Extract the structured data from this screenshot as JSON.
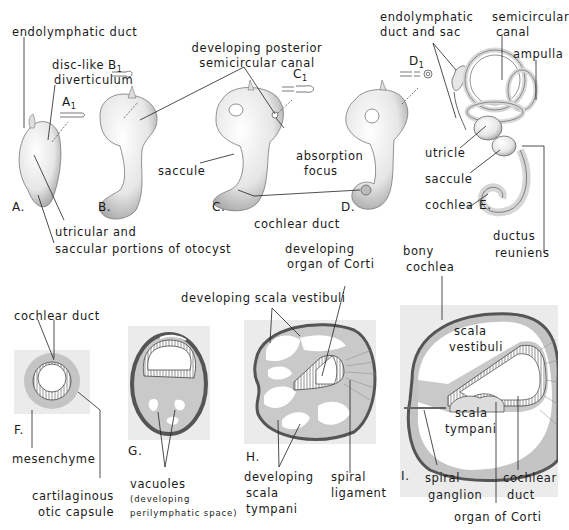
{
  "figure": {
    "top_row": {
      "panels": [
        {
          "id": "A",
          "label": "A.",
          "inset": "A",
          "inset_sub": "1"
        },
        {
          "id": "B",
          "label": "B.",
          "inset": "B",
          "inset_sub": "1"
        },
        {
          "id": "C",
          "label": "C.",
          "inset": "C",
          "inset_sub": "1"
        },
        {
          "id": "D",
          "label": "D.",
          "inset": "D",
          "inset_sub": "1"
        },
        {
          "id": "E",
          "label": "E."
        }
      ],
      "labels": {
        "endolymphatic_duct": "endolymphatic duct",
        "disc_like_1": "disc-like",
        "disc_like_2": "diverticulum",
        "dev_post_1": "developing posterior",
        "dev_post_2": "semicircular canal",
        "endo_duct_sac_1": "endolymphatic",
        "endo_duct_sac_2": "duct and sac",
        "semicircular_1": "semicircular",
        "semicircular_2": "canal",
        "ampulla": "ampulla",
        "saccule_c": "saccule",
        "absorption_1": "absorption",
        "absorption_2": "focus",
        "utricle": "utricle",
        "saccule_e": "saccule",
        "cochlea": "cochlea",
        "cochlear_duct": "cochlear duct",
        "utricular_1": "utricular and",
        "utricular_2": "saccular portions of otocyst",
        "ductus_1": "ductus",
        "ductus_2": "reuniens"
      }
    },
    "bottom_row": {
      "panels": [
        {
          "id": "F",
          "label": "F."
        },
        {
          "id": "G",
          "label": "G."
        },
        {
          "id": "H",
          "label": "H."
        },
        {
          "id": "I",
          "label": "I."
        }
      ],
      "labels": {
        "cochlear_duct_f": "cochlear duct",
        "mesenchyme": "mesenchyme",
        "cartilaginous_1": "cartilaginous",
        "cartilaginous_2": "otic capsule",
        "vacuoles": "vacuoles",
        "vacuoles_sub_1": "(developing",
        "vacuoles_sub_2": "perilymphatic space)",
        "dev_corti_1": "developing",
        "dev_corti_2": "organ of Corti",
        "dev_scala_vest": "developing scala vestibuli",
        "dev_scala_tymp_1": "developing",
        "dev_scala_tymp_2": "scala",
        "dev_scala_tymp_3": "tympani",
        "spiral_lig_1": "spiral",
        "spiral_lig_2": "ligament",
        "bony_1": "bony",
        "bony_2": "cochlea",
        "scala_vest_1": "scala",
        "scala_vest_2": "vestibuli",
        "scala_tymp_1": "scala",
        "scala_tymp_2": "tympani",
        "spiral_gang_1": "spiral",
        "spiral_gang_2": "ganglion",
        "cochlear_duct_i_1": "cochlear",
        "cochlear_duct_i_2": "duct",
        "organ_corti": "organ of Corti"
      }
    },
    "colors": {
      "tissue_gray": "#c9c9c9",
      "background_box": "#ebebeb",
      "capsule_dark": "#555555",
      "line": "#1a1a1a"
    }
  }
}
